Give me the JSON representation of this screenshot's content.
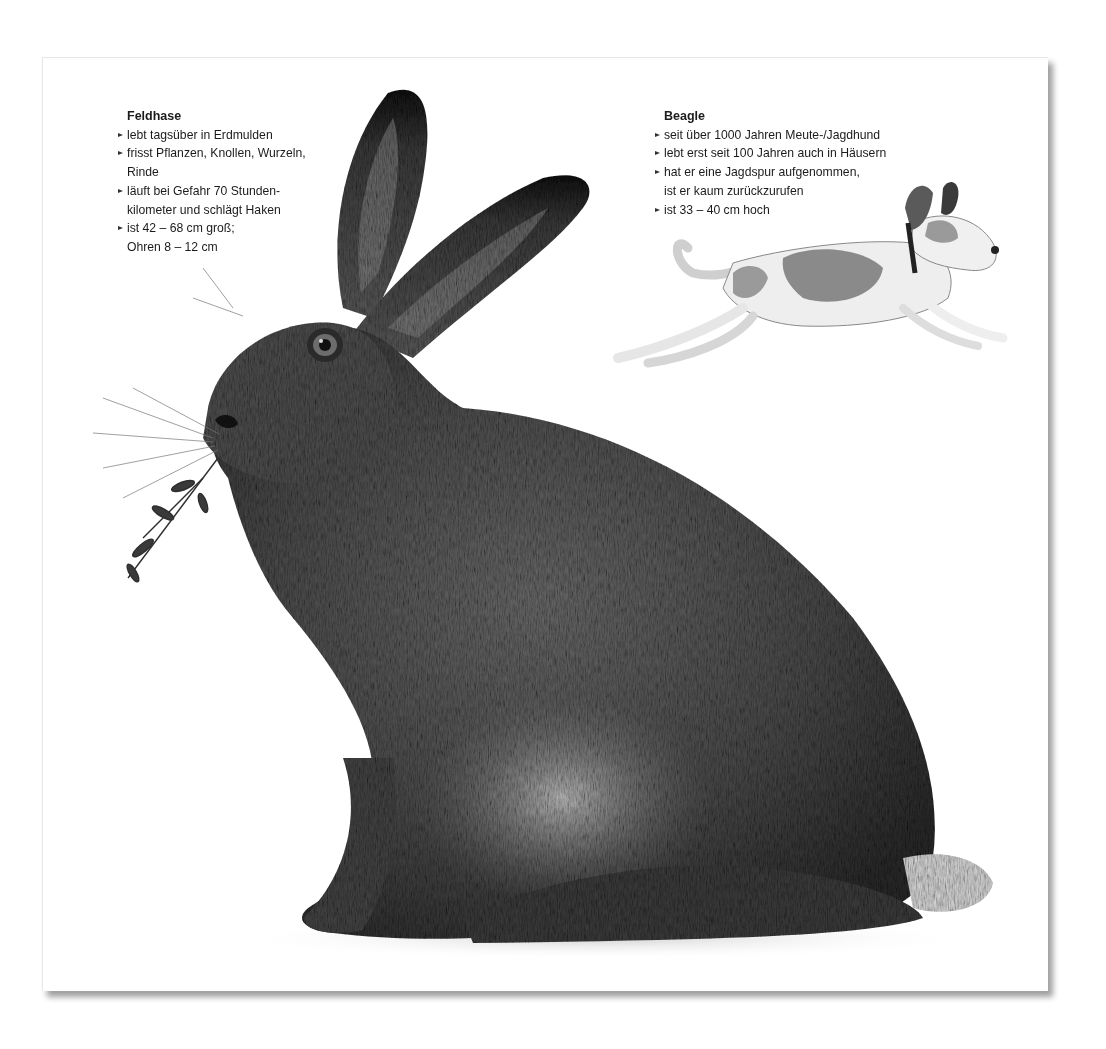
{
  "card": {
    "hare": {
      "title": "Feldhase",
      "bullets": [
        [
          "lebt tagsüber in Erdmulden"
        ],
        [
          "frisst Pflanzen, Knollen, Wurzeln,",
          "Rinde"
        ],
        [
          "läuft bei Gefahr 70 Stunden-",
          "kilometer und schlägt Haken"
        ],
        [
          "ist 42 – 68 cm groß;",
          "Ohren 8 – 12 cm"
        ]
      ],
      "illustration": "sitting-hare-with-twig"
    },
    "beagle": {
      "title": "Beagle",
      "bullets": [
        [
          "seit über 1000 Jahren Meute-/Jagdhund"
        ],
        [
          "lebt erst seit 100 Jahren auch in Häusern"
        ],
        [
          "hat er eine Jagdspur aufgenommen,",
          "ist er kaum zurückzurufen"
        ],
        [
          "ist 33 – 40 cm hoch"
        ]
      ],
      "illustration": "running-beagle"
    }
  },
  "colors": {
    "background": "#ffffff",
    "text": "#1b1b1b",
    "shadow": "#8a8a8a"
  }
}
